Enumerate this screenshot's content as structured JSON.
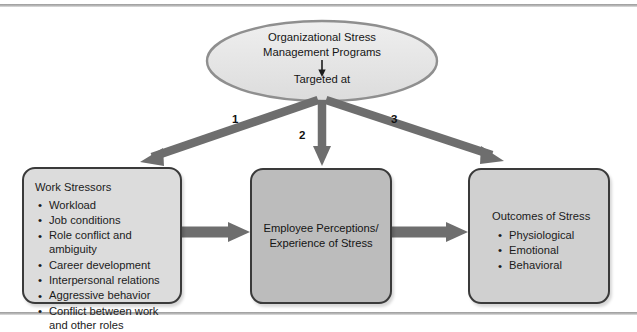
{
  "diagram": {
    "title_node": {
      "line1": "Organizational Stress",
      "line2": "Management Programs",
      "sub": "Targeted at",
      "shape": "ellipse",
      "fill": "#e8e8e8",
      "stroke": "#8c8c8c"
    },
    "arrow_numbers": {
      "left": "1",
      "middle": "2",
      "right": "3"
    },
    "nodes": {
      "work_stressors": {
        "title": "Work Stressors",
        "items": [
          "Workload",
          "Job conditions",
          "Role conflict and ambiguity",
          "Career development",
          "Interpersonal relations",
          "Aggressive behavior",
          "Conflict between work and other roles"
        ],
        "fill": "#dcdcdc"
      },
      "employee_perceptions": {
        "line1": "Employee Perceptions/",
        "line2": "Experience of Stress",
        "fill": "#bcbcbc"
      },
      "outcomes_of_stress": {
        "title": "Outcomes of Stress",
        "items": [
          "Physiological",
          "Emotional",
          "Behavioral"
        ],
        "fill": "#d0d0d0"
      }
    },
    "colors": {
      "arrow": "#6e6e6e",
      "box_border": "#3a3a3a",
      "rule": "#a5a5a5"
    }
  }
}
